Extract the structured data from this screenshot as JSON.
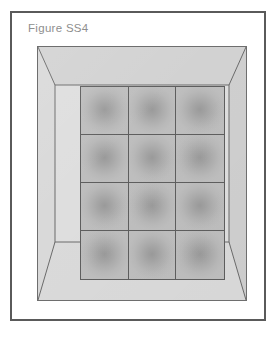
{
  "figure": {
    "caption": "Figure SS4",
    "caption_color": "#8e8e8e",
    "border_color": "#5a5a5a",
    "page_background": "#ffffff"
  },
  "frame": {
    "name": "perspective-frame",
    "face_color": "#dedede",
    "bevel_top_color": "#d2d2d2",
    "bevel_left_color": "#d8d8d8",
    "bevel_right_color": "#cfcfcf",
    "bevel_bottom_color": "#d9d9d9",
    "outline_color": "#6e6e6e",
    "mitre_line_color": "#6a6a6a"
  },
  "panel": {
    "name": "tile-grid-panel",
    "columns": 3,
    "rows": 4,
    "cell_count": 12,
    "outline_color": "#5e5e5e",
    "gridline_color": "#5e5e5e",
    "cell_center_color": "#9a9a9a",
    "cell_edge_color": "#bebebe",
    "cells": [
      {
        "row": 1,
        "col": 1
      },
      {
        "row": 1,
        "col": 2
      },
      {
        "row": 1,
        "col": 3
      },
      {
        "row": 2,
        "col": 1
      },
      {
        "row": 2,
        "col": 2
      },
      {
        "row": 2,
        "col": 3
      },
      {
        "row": 3,
        "col": 1
      },
      {
        "row": 3,
        "col": 2
      },
      {
        "row": 3,
        "col": 3
      },
      {
        "row": 4,
        "col": 1
      },
      {
        "row": 4,
        "col": 2
      },
      {
        "row": 4,
        "col": 3
      }
    ]
  }
}
